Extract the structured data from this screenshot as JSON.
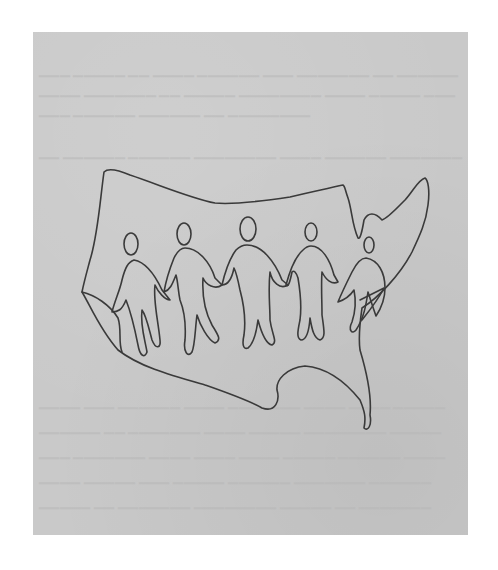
{
  "image": {
    "subject": "hand-drawn sketch of United States outline with five figures holding hands",
    "medium": "pencil/pen line drawing on gray paper",
    "figure_count": 5,
    "colors": {
      "background": "#ffffff",
      "paper": "#c9c9c9",
      "ink": "#3a3a3a",
      "bleed_text": "#b7b7b7"
    }
  }
}
